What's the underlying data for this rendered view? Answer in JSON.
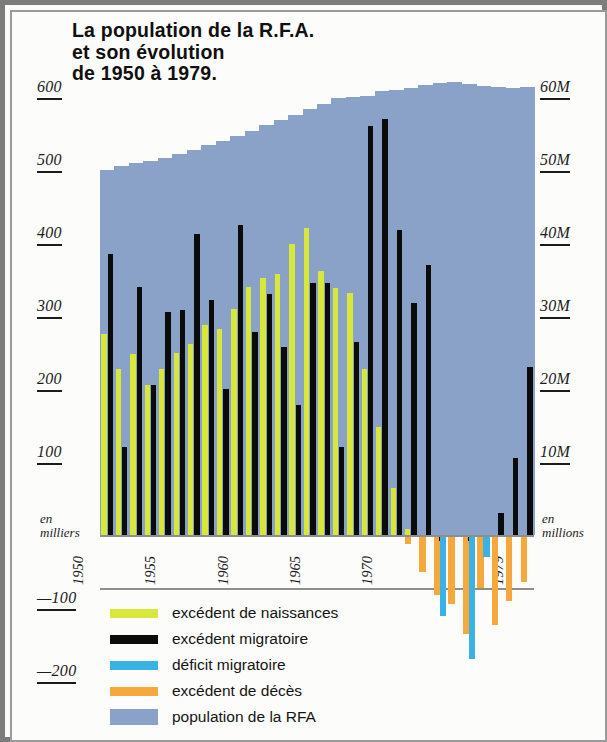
{
  "title": {
    "line1": "La population de la R.F.A.",
    "line2": "et son évolution",
    "line3": "de 1950 à 1979."
  },
  "axes": {
    "left_unit_line1": "en",
    "left_unit_line2": "milliers",
    "right_unit_line1": "en",
    "right_unit_line2": "millions",
    "left_ticks": [
      "600",
      "500",
      "400",
      "300",
      "200",
      "100"
    ],
    "left_neg_ticks": [
      "—100",
      "—200"
    ],
    "right_ticks": [
      "60M",
      "50M",
      "40M",
      "30M",
      "20M",
      "10M"
    ],
    "year_ticks": [
      "1950",
      "1955",
      "1960",
      "1965",
      "1970",
      "1975",
      "1979"
    ]
  },
  "legend": [
    {
      "label": "excédent de naissances",
      "color": "#d8e83a",
      "shape": "bar"
    },
    {
      "label": "excédent  migratoire",
      "color": "#0b0b0b",
      "shape": "bar"
    },
    {
      "label": "déficit migratoire",
      "color": "#3ab2e6",
      "shape": "bar"
    },
    {
      "label": "excédent de décès",
      "color": "#f5a93c",
      "shape": "bar"
    },
    {
      "label": "population de la RFA",
      "color": "#8ba2c8",
      "shape": "area"
    }
  ],
  "colors": {
    "births_surplus": "#d8e83a",
    "migration_surplus": "#0b0b0b",
    "migration_deficit": "#3ab2e6",
    "deaths_surplus": "#f5a93c",
    "population_area": "#8ba2c8",
    "frame": "#7c7c7c",
    "background": "#fcfcfa"
  },
  "chart_data": {
    "type": "bar",
    "title": "La population de la R.F.A. et son évolution de 1950 à 1979.",
    "subtitle": "",
    "xlabel": "",
    "ylabel": "en milliers",
    "y2label": "en millions",
    "ylim": [
      -200,
      620
    ],
    "y2lim": [
      0,
      62
    ],
    "grid": false,
    "legend_position": "bottom-left",
    "x": [
      1950,
      1951,
      1952,
      1953,
      1954,
      1955,
      1956,
      1957,
      1958,
      1959,
      1960,
      1961,
      1962,
      1963,
      1964,
      1965,
      1966,
      1967,
      1968,
      1969,
      1970,
      1971,
      1972,
      1973,
      1974,
      1975,
      1976,
      1977,
      1978,
      1979
    ],
    "series": [
      {
        "name": "excédent de naissances",
        "color": "#d8e83a",
        "unit": "milliers",
        "values": [
          275,
          228,
          248,
          205,
          228,
          250,
          262,
          288,
          282,
          310,
          340,
          352,
          358,
          398,
          420,
          362,
          338,
          332,
          228,
          148,
          65,
          8,
          0,
          0,
          0,
          0,
          0,
          0,
          0,
          0
        ]
      },
      {
        "name": "excédent migratoire",
        "color": "#0b0b0b",
        "unit": "milliers",
        "values": [
          385,
          120,
          340,
          205,
          305,
          308,
          412,
          322,
          200,
          425,
          278,
          330,
          258,
          178,
          345,
          345,
          120,
          265,
          560,
          570,
          418,
          318,
          370,
          0,
          0,
          0,
          0,
          30,
          105,
          230
        ]
      },
      {
        "name": "déficit migratoire",
        "color": "#3ab2e6",
        "unit": "milliers",
        "values": [
          0,
          0,
          0,
          0,
          0,
          0,
          0,
          0,
          0,
          0,
          0,
          0,
          0,
          0,
          0,
          0,
          0,
          0,
          0,
          0,
          0,
          0,
          0,
          -108,
          0,
          -167,
          -28,
          0,
          0,
          0
        ]
      },
      {
        "name": "excédent de décès",
        "color": "#f5a93c",
        "unit": "milliers",
        "values": [
          0,
          0,
          0,
          0,
          0,
          0,
          0,
          0,
          0,
          0,
          0,
          0,
          0,
          0,
          0,
          0,
          0,
          0,
          0,
          0,
          0,
          -10,
          -48,
          -80,
          -92,
          -133,
          -70,
          -120,
          -87,
          -62
        ]
      },
      {
        "name": "population de la RFA",
        "color": "#8ba2c8",
        "unit": "millions",
        "axis": "right",
        "values": [
          50.0,
          50.5,
          50.9,
          51.3,
          51.7,
          52.2,
          52.8,
          53.4,
          54.0,
          54.6,
          55.4,
          56.2,
          56.9,
          57.6,
          58.3,
          59.0,
          59.8,
          60.0,
          60.2,
          60.8,
          61.0,
          61.3,
          61.7,
          61.9,
          62.0,
          61.8,
          61.5,
          61.4,
          61.3,
          61.4
        ]
      }
    ]
  }
}
